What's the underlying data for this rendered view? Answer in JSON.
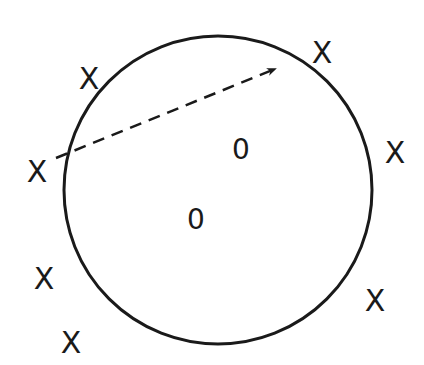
{
  "diagram": {
    "background": "#ffffff",
    "stroke_color": "#1a1a1a",
    "circle": {
      "cx": 218,
      "cy": 190,
      "r": 154
    },
    "arrow": {
      "x1": 56,
      "y1": 158,
      "x2": 275,
      "y2": 69,
      "style": "dashed"
    },
    "outside_points": [
      {
        "label": "X",
        "x": 89,
        "y": 78
      },
      {
        "label": "X",
        "x": 322,
        "y": 52
      },
      {
        "label": "X",
        "x": 37,
        "y": 171
      },
      {
        "label": "X",
        "x": 395,
        "y": 152
      },
      {
        "label": "X",
        "x": 44,
        "y": 278
      },
      {
        "label": "X",
        "x": 71,
        "y": 342
      },
      {
        "label": "X",
        "x": 375,
        "y": 300
      }
    ],
    "inside_points": [
      {
        "label": "0",
        "x": 241,
        "y": 149
      },
      {
        "label": "0",
        "x": 196,
        "y": 219
      }
    ]
  }
}
